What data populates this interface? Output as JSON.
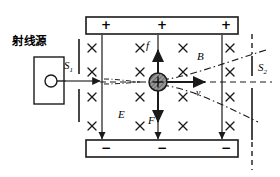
{
  "diagram": {
    "source_label": "射线源",
    "slit1_label": "S",
    "slit1_sub": "1",
    "slit2_label": "S",
    "slit2_sub": "2",
    "field_b_label": "B",
    "field_e_label": "E",
    "force_up_label": "f",
    "force_down_label": "F",
    "velocity_label": "v",
    "plate_top_signs": [
      "+",
      "+",
      "+"
    ],
    "plate_bottom_signs": [
      "−",
      "−",
      "−"
    ],
    "b_field_marker": "×",
    "b_field_marker_count": 16,
    "b_field_rows": 4,
    "b_field_cols": 4,
    "stroke_color": "#1a1a1a",
    "fill_color": "#ffffff",
    "particle_fill": "#9a9a9a",
    "charge_symbol": "+"
  }
}
